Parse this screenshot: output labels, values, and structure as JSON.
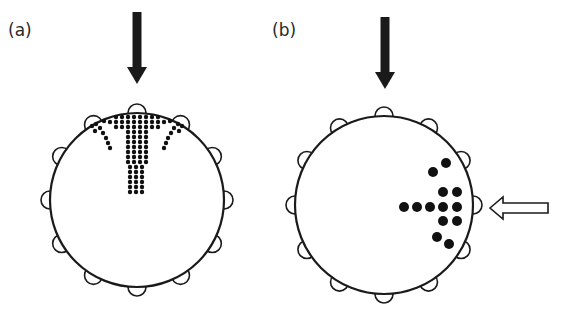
{
  "panels": [
    {
      "label": "(a)",
      "label_pos": [
        8,
        18
      ],
      "circle": {
        "cx": 137,
        "cy": 200,
        "r": 87
      },
      "bump_count": 12,
      "bump_r": 9,
      "arrow_down": {
        "x": 137,
        "y1": 12,
        "y2": 84
      },
      "dot_radius": 2.2,
      "dot_pattern": "fan-shaped spread (top entry)"
    },
    {
      "label": "(b)",
      "label_pos": [
        272,
        18
      ],
      "circle": {
        "cx": 384,
        "cy": 205,
        "r": 89
      },
      "bump_count": 12,
      "bump_r": 9,
      "arrow_down": {
        "x": 385,
        "y1": 17,
        "y2": 89
      },
      "arrow_left_outline": {
        "x1": 548,
        "x2": 490,
        "y": 208
      },
      "dot_radius": 5,
      "dot_pattern": "branching cluster (right entry)"
    }
  ],
  "colors": {
    "stroke": "#1a1a1a",
    "fill": "#ffffff",
    "dot": "#111111"
  }
}
